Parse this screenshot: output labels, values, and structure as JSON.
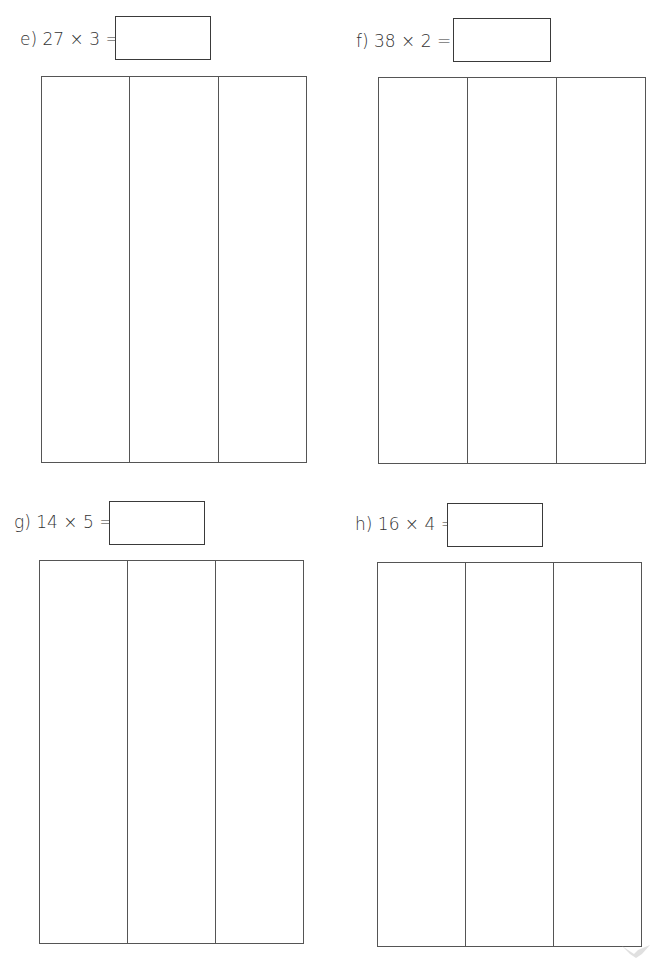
{
  "questions": [
    {
      "id": "e",
      "label": "e)  27 × 3 =",
      "answer": "",
      "columns": 3
    },
    {
      "id": "f",
      "label": "f)  38 × 2 =",
      "answer": "",
      "columns": 3
    },
    {
      "id": "g",
      "label": "g)  14 × 5 =",
      "answer": "",
      "columns": 3
    },
    {
      "id": "h",
      "label": "h)  16 × 4 =",
      "answer": "",
      "columns": 3
    }
  ],
  "icons": {
    "logo": "bird-logo-icon"
  }
}
